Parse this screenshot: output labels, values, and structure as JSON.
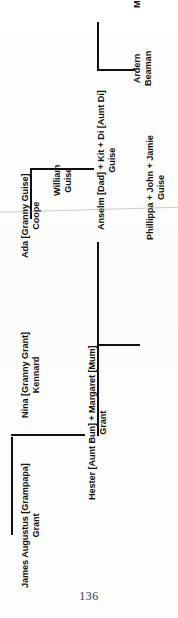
{
  "document": {
    "kind": "family-tree-diagram",
    "folio": "136",
    "orientation": "text rotated 90 degrees counter-clockwise"
  },
  "tree": {
    "nodes": [
      {
        "id": "william-guise",
        "line1": "William",
        "line2": "Guise",
        "generation": 1,
        "family": "Guise"
      },
      {
        "id": "ada-coope",
        "line1": "Ada [Granny Guise]",
        "line2": "Coope",
        "generation": 1,
        "family": "Guise"
      },
      {
        "id": "anselm-kit-di-guise",
        "line1": "Anselm [Dad] + Kit + Di [Aunt Di]",
        "line2": "Guise",
        "generation": 2,
        "family": "Guise"
      },
      {
        "id": "ardern-beaman",
        "line1": "Ardern",
        "line2": "Beaman",
        "generation": 2,
        "family": "Beaman"
      },
      {
        "id": "mike-david-beaman",
        "line1": "Mike + David",
        "line2": "Beaman",
        "generation": 3,
        "family": "Beaman"
      },
      {
        "id": "phillippa-john-jamie-guise",
        "line1": "Phillippa + John + Jamie",
        "line2": "Guise",
        "generation": 3,
        "family": "Guise"
      },
      {
        "id": "james-augustus-grant",
        "line1": "James Augustus [Grampapa]",
        "line2": "Grant",
        "generation": 1,
        "family": "Grant"
      },
      {
        "id": "nina-kennard",
        "line1": "Nina [Granny Grant]",
        "line2": "Kennard",
        "generation": 1,
        "family": "Grant"
      },
      {
        "id": "hester-margaret-grant",
        "line1": "Hester [Aunt Bun] + Margaret [Mum]",
        "line2": "Grant",
        "generation": 2,
        "family": "Grant"
      }
    ]
  },
  "colors": {
    "ink": "#111111",
    "paper": "#fdfdfc",
    "folio_ink": "#3a3a3a"
  }
}
